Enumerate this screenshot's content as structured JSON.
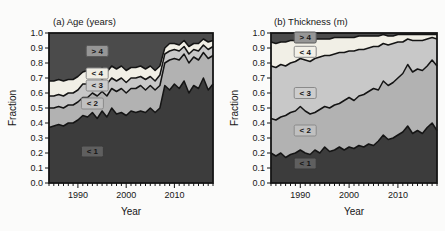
{
  "figure": {
    "background": "#fbfbfa",
    "line_color": "#141414"
  },
  "chart_data": [
    {
      "type": "area",
      "stacked": true,
      "title": "(a) Age (years)",
      "xlabel": "Year",
      "ylabel": "Fraction",
      "xlim": [
        1984,
        2018
      ],
      "ylim": [
        0.0,
        1.0
      ],
      "grid": false,
      "xticks": [
        {
          "year": 1990,
          "label": "1990"
        },
        {
          "year": 2000,
          "label": "2000"
        },
        {
          "year": 2010,
          "label": "2010"
        }
      ],
      "yticks": [
        {
          "value": 0.0,
          "label": "0.0"
        },
        {
          "value": 0.1,
          "label": "0.1"
        },
        {
          "value": 0.2,
          "label": "0.2"
        },
        {
          "value": 0.3,
          "label": "0.3"
        },
        {
          "value": 0.4,
          "label": "0.4"
        },
        {
          "value": 0.5,
          "label": "0.5"
        },
        {
          "value": 0.6,
          "label": "0.6"
        },
        {
          "value": 0.7,
          "label": "0.7"
        },
        {
          "value": 0.8,
          "label": "0.8"
        },
        {
          "value": 0.9,
          "label": "0.9"
        },
        {
          "value": 1.0,
          "label": "1.0"
        }
      ],
      "years": [
        1984,
        1985,
        1986,
        1987,
        1988,
        1989,
        1990,
        1991,
        1992,
        1993,
        1994,
        1995,
        1996,
        1997,
        1998,
        1999,
        2000,
        2001,
        2002,
        2003,
        2004,
        2005,
        2006,
        2007,
        2008,
        2009,
        2010,
        2011,
        2012,
        2013,
        2014,
        2015,
        2016,
        2017,
        2018
      ],
      "series": [
        {
          "name": "< 1",
          "color": "#3c3c3c",
          "cumulative_top": [
            0.37,
            0.38,
            0.39,
            0.38,
            0.4,
            0.4,
            0.42,
            0.45,
            0.44,
            0.47,
            0.43,
            0.48,
            0.44,
            0.5,
            0.46,
            0.47,
            0.45,
            0.48,
            0.47,
            0.48,
            0.47,
            0.5,
            0.47,
            0.5,
            0.65,
            0.62,
            0.66,
            0.63,
            0.68,
            0.6,
            0.65,
            0.63,
            0.7,
            0.62,
            0.66
          ]
        },
        {
          "name": "< 2",
          "color": "#b2b2b2",
          "cumulative_top": [
            0.5,
            0.5,
            0.51,
            0.5,
            0.52,
            0.52,
            0.54,
            0.57,
            0.57,
            0.6,
            0.58,
            0.61,
            0.58,
            0.63,
            0.61,
            0.63,
            0.6,
            0.63,
            0.63,
            0.65,
            0.62,
            0.65,
            0.62,
            0.65,
            0.8,
            0.82,
            0.83,
            0.82,
            0.86,
            0.8,
            0.84,
            0.82,
            0.87,
            0.83,
            0.85
          ]
        },
        {
          "name": "< 3",
          "color": "#c8c8c8",
          "cumulative_top": [
            0.58,
            0.58,
            0.59,
            0.58,
            0.6,
            0.6,
            0.62,
            0.66,
            0.66,
            0.68,
            0.66,
            0.69,
            0.66,
            0.7,
            0.68,
            0.7,
            0.67,
            0.7,
            0.7,
            0.71,
            0.69,
            0.71,
            0.68,
            0.72,
            0.86,
            0.88,
            0.89,
            0.88,
            0.91,
            0.86,
            0.89,
            0.88,
            0.92,
            0.89,
            0.91
          ]
        },
        {
          "name": "< 4",
          "color": "#f1efe6",
          "cumulative_top": [
            0.68,
            0.68,
            0.69,
            0.68,
            0.69,
            0.69,
            0.71,
            0.74,
            0.75,
            0.76,
            0.74,
            0.77,
            0.74,
            0.78,
            0.76,
            0.78,
            0.75,
            0.77,
            0.77,
            0.78,
            0.76,
            0.78,
            0.75,
            0.78,
            0.9,
            0.93,
            0.93,
            0.92,
            0.95,
            0.91,
            0.93,
            0.93,
            0.96,
            0.94,
            0.95
          ]
        },
        {
          "name": "> 4",
          "color": "#4b4b4b",
          "cumulative_top": null
        }
      ],
      "annotations": [
        {
          "label": "> 4",
          "year": 1994,
          "fraction": 0.88,
          "fill": "#969696",
          "border": "#5a5a5a"
        },
        {
          "label": "< 4",
          "year": 1994,
          "fraction": 0.73,
          "fill": "#efede4",
          "border": "#8a8a8a"
        },
        {
          "label": "< 3",
          "year": 1994,
          "fraction": 0.65,
          "fill": "#cdcdcd",
          "border": "#8a8a8a"
        },
        {
          "label": "< 2",
          "year": 1993,
          "fraction": 0.53,
          "fill": "#c0c0c0",
          "border": "#8a8a8a"
        },
        {
          "label": "< 1",
          "year": 1993,
          "fraction": 0.21,
          "fill": "#5f5f5f",
          "border": "#3a3a3a"
        }
      ]
    },
    {
      "type": "area",
      "stacked": true,
      "title": "(b) Thickness (m)",
      "xlabel": "Year",
      "ylabel": "Fraction",
      "xlim": [
        1984,
        2018
      ],
      "ylim": [
        0.0,
        1.0
      ],
      "grid": false,
      "xticks": [
        {
          "year": 1990,
          "label": "1990"
        },
        {
          "year": 2000,
          "label": "2000"
        },
        {
          "year": 2010,
          "label": "2010"
        }
      ],
      "yticks": [
        {
          "value": 0.0,
          "label": "0.0"
        },
        {
          "value": 0.1,
          "label": "0.1"
        },
        {
          "value": 0.2,
          "label": "0.2"
        },
        {
          "value": 0.3,
          "label": "0.3"
        },
        {
          "value": 0.4,
          "label": "0.4"
        },
        {
          "value": 0.5,
          "label": "0.5"
        },
        {
          "value": 0.6,
          "label": "0.6"
        },
        {
          "value": 0.7,
          "label": "0.7"
        },
        {
          "value": 0.8,
          "label": "0.8"
        },
        {
          "value": 0.9,
          "label": "0.9"
        },
        {
          "value": 1.0,
          "label": "1.0"
        }
      ],
      "years": [
        1984,
        1985,
        1986,
        1987,
        1988,
        1989,
        1990,
        1991,
        1992,
        1993,
        1994,
        1995,
        1996,
        1997,
        1998,
        1999,
        2000,
        2001,
        2002,
        2003,
        2004,
        2005,
        2006,
        2007,
        2008,
        2009,
        2010,
        2011,
        2012,
        2013,
        2014,
        2015,
        2016,
        2017,
        2018
      ],
      "series": [
        {
          "name": "< 1",
          "color": "#3c3c3c",
          "cumulative_top": [
            0.2,
            0.18,
            0.2,
            0.17,
            0.19,
            0.2,
            0.22,
            0.2,
            0.19,
            0.22,
            0.2,
            0.24,
            0.21,
            0.22,
            0.24,
            0.22,
            0.24,
            0.23,
            0.25,
            0.24,
            0.26,
            0.25,
            0.28,
            0.32,
            0.29,
            0.3,
            0.32,
            0.34,
            0.38,
            0.33,
            0.35,
            0.33,
            0.37,
            0.4,
            0.35
          ]
        },
        {
          "name": "< 2",
          "color": "#b2b2b2",
          "cumulative_top": [
            0.43,
            0.42,
            0.44,
            0.45,
            0.47,
            0.48,
            0.51,
            0.48,
            0.46,
            0.47,
            0.49,
            0.51,
            0.5,
            0.52,
            0.53,
            0.55,
            0.57,
            0.55,
            0.58,
            0.59,
            0.61,
            0.63,
            0.62,
            0.68,
            0.65,
            0.67,
            0.7,
            0.73,
            0.79,
            0.74,
            0.76,
            0.75,
            0.78,
            0.82,
            0.78
          ]
        },
        {
          "name": "< 3",
          "color": "#c8c8c8",
          "cumulative_top": [
            0.78,
            0.77,
            0.79,
            0.78,
            0.8,
            0.81,
            0.83,
            0.82,
            0.81,
            0.83,
            0.84,
            0.85,
            0.85,
            0.86,
            0.87,
            0.87,
            0.88,
            0.88,
            0.89,
            0.89,
            0.9,
            0.91,
            0.91,
            0.93,
            0.92,
            0.93,
            0.94,
            0.94,
            0.96,
            0.95,
            0.95,
            0.95,
            0.96,
            0.97,
            0.96
          ]
        },
        {
          "name": "< 4",
          "color": "#f1efe6",
          "cumulative_top": [
            0.94,
            0.93,
            0.94,
            0.94,
            0.95,
            0.95,
            0.96,
            0.95,
            0.95,
            0.96,
            0.96,
            0.96,
            0.96,
            0.97,
            0.97,
            0.97,
            0.97,
            0.97,
            0.98,
            0.98,
            0.98,
            0.98,
            0.98,
            0.99,
            0.98,
            0.98,
            0.99,
            0.99,
            0.99,
            0.99,
            0.99,
            0.99,
            0.99,
            0.99,
            0.99
          ]
        },
        {
          "name": "> 4",
          "color": "#4b4b4b",
          "cumulative_top": null
        }
      ],
      "annotations": [
        {
          "label": "> 4",
          "year": 1991,
          "fraction": 0.97,
          "fill": "#969696",
          "border": "#5a5a5a"
        },
        {
          "label": "< 4",
          "year": 1991,
          "fraction": 0.875,
          "fill": "#f2f0e8",
          "border": "#8a8a8a"
        },
        {
          "label": "< 3",
          "year": 1991,
          "fraction": 0.6,
          "fill": "#cdcdcd",
          "border": "#8a8a8a"
        },
        {
          "label": "< 2",
          "year": 1991,
          "fraction": 0.35,
          "fill": "#c0c0c0",
          "border": "#8a8a8a"
        },
        {
          "label": "< 1",
          "year": 1991,
          "fraction": 0.13,
          "fill": "#5f5f5f",
          "border": "#3a3a3a"
        }
      ]
    }
  ]
}
